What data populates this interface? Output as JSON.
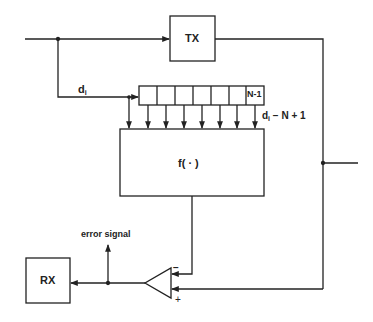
{
  "blocks": {
    "tx": {
      "label": "TX"
    },
    "rx": {
      "label": "RX"
    },
    "func": {
      "label": "f( · )"
    },
    "register": {
      "last_cell_label": "N-1",
      "cell_count": 7
    }
  },
  "signals": {
    "input_tap": {
      "base": "d",
      "sub": "i"
    },
    "last_tap": {
      "base": "d",
      "sub": "i",
      "suffix": " − N + 1"
    },
    "error": {
      "label": "error signal"
    }
  },
  "comparator": {
    "minus": "−",
    "plus": "+"
  },
  "colors": {
    "line": "#222222",
    "background": "#ffffff"
  }
}
